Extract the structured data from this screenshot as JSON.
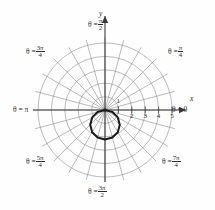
{
  "chart_data": {
    "type": "line",
    "subtype": "polar",
    "title": "",
    "xlabel": "x",
    "ylabel": "y",
    "grid": true,
    "legend": false,
    "origin": {
      "x": 105,
      "y": 110
    },
    "unit_px": 13.4,
    "radial_ticks": [
      1,
      2,
      3,
      4,
      5
    ],
    "radial_tick_labels": [
      "1",
      "2",
      "3",
      "4",
      "5"
    ],
    "radial_max": 5,
    "angular_step_deg": 15,
    "angular_spokes": 24,
    "angle_labels": [
      {
        "id": "theta-0",
        "text_theta": "θ =",
        "value": "0",
        "frac": false,
        "deg": 0
      },
      {
        "id": "theta-pi-4",
        "text_theta": "θ =",
        "num": "π",
        "den": "4",
        "frac": true,
        "deg": 45
      },
      {
        "id": "theta-pi-2",
        "text_theta": "θ =",
        "num": "π",
        "den": "2",
        "frac": true,
        "deg": 90
      },
      {
        "id": "theta-3pi-4",
        "text_theta": "θ =",
        "num": "3π",
        "den": "4",
        "frac": true,
        "deg": 135
      },
      {
        "id": "theta-pi",
        "text_theta": "θ =",
        "value": "π",
        "frac": false,
        "deg": 180
      },
      {
        "id": "theta-5pi-4",
        "text_theta": "θ =",
        "num": "5π",
        "den": "4",
        "frac": true,
        "deg": 225
      },
      {
        "id": "theta-3pi-2",
        "text_theta": "θ =",
        "num": "3π",
        "den": "2",
        "frac": true,
        "deg": 270
      },
      {
        "id": "theta-7pi-4",
        "text_theta": "θ =",
        "num": "7π",
        "den": "4",
        "frac": true,
        "deg": 315
      }
    ],
    "curve": {
      "name": "r = -2.2 sin(θ)",
      "equation_type": "circle-through-origin",
      "amplitude_r": 2.2,
      "center_polar": {
        "r": 1.1,
        "theta_deg": 270
      },
      "center_cartesian": {
        "x": 0.0,
        "y": -1.1
      },
      "radius": 1.1,
      "points_polar": [
        {
          "theta_deg": 0,
          "r": 0.0
        },
        {
          "theta_deg": 15,
          "r": -0.57
        },
        {
          "theta_deg": 30,
          "r": -1.1
        },
        {
          "theta_deg": 45,
          "r": -1.56
        },
        {
          "theta_deg": 60,
          "r": -1.91
        },
        {
          "theta_deg": 75,
          "r": -2.13
        },
        {
          "theta_deg": 90,
          "r": -2.2
        },
        {
          "theta_deg": 105,
          "r": -2.13
        },
        {
          "theta_deg": 120,
          "r": -1.91
        },
        {
          "theta_deg": 135,
          "r": -1.56
        },
        {
          "theta_deg": 150,
          "r": -1.1
        },
        {
          "theta_deg": 165,
          "r": -0.57
        },
        {
          "theta_deg": 180,
          "r": 0.0
        }
      ],
      "color": "#1a1a1a",
      "linewidth": 2.0
    },
    "colors": {
      "grid": "#8d8d8d",
      "axis": "#3a3a3a",
      "curve": "#1a1a1a",
      "text": "#2b2b2b",
      "background": "#fefefe"
    }
  }
}
